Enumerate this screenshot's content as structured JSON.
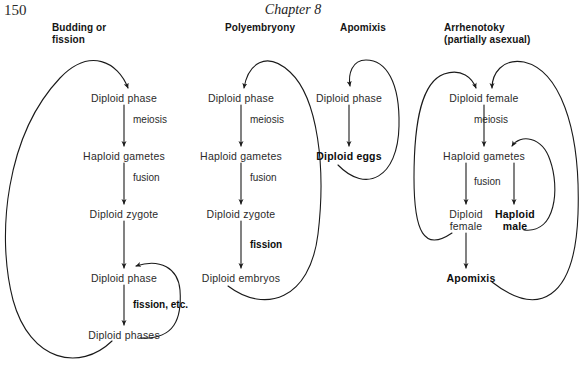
{
  "page": {
    "number": "150",
    "running_head": "Chapter 8"
  },
  "columns": [
    {
      "id": "budding-or-fission",
      "heading_lines": [
        "Budding or",
        "fission"
      ],
      "nodes": [
        {
          "id": "c1-n1",
          "text": "Diploid phase",
          "bold": false,
          "x": 123,
          "y": 97
        },
        {
          "id": "c1-n2",
          "text": "Haploid gametes",
          "bold": false,
          "x": 123,
          "y": 155
        },
        {
          "id": "c1-n3",
          "text": "Diploid zygote",
          "bold": false,
          "x": 123,
          "y": 213
        },
        {
          "id": "c1-n4",
          "text": "Diploid phase",
          "bold": false,
          "x": 123,
          "y": 277
        },
        {
          "id": "c1-n5",
          "text": "Diploid phases",
          "bold": false,
          "x": 123,
          "y": 334
        }
      ],
      "edge_labels": [
        {
          "id": "c1-e1",
          "text": "meiosis",
          "bold": false,
          "x": 131,
          "y": 119
        },
        {
          "id": "c1-e2",
          "text": "fusion",
          "bold": false,
          "x": 131,
          "y": 177
        },
        {
          "id": "c1-e3",
          "text": "fission, etc.",
          "bold": true,
          "x": 131,
          "y": 304
        }
      ]
    },
    {
      "id": "polyembryony",
      "heading_lines": [
        "Polyembryony"
      ],
      "nodes": [
        {
          "id": "c2-n1",
          "text": "Diploid phase",
          "bold": false,
          "x": 240,
          "y": 97
        },
        {
          "id": "c2-n2",
          "text": "Haploid gametes",
          "bold": false,
          "x": 240,
          "y": 155
        },
        {
          "id": "c2-n3",
          "text": "Diploid zygote",
          "bold": false,
          "x": 240,
          "y": 213
        },
        {
          "id": "c2-n4",
          "text": "Diploid embryos",
          "bold": false,
          "x": 240,
          "y": 277
        }
      ],
      "edge_labels": [
        {
          "id": "c2-e1",
          "text": "meiosis",
          "bold": false,
          "x": 248,
          "y": 119
        },
        {
          "id": "c2-e2",
          "text": "fusion",
          "bold": false,
          "x": 248,
          "y": 177
        },
        {
          "id": "c2-e3",
          "text": "fission",
          "bold": true,
          "x": 248,
          "y": 244
        }
      ]
    },
    {
      "id": "apomixis",
      "heading_lines": [
        "Apomixis"
      ],
      "nodes": [
        {
          "id": "c3-n1",
          "text": "Diploid phase",
          "bold": false,
          "x": 348,
          "y": 97
        },
        {
          "id": "c3-n2",
          "text": "Diploid eggs",
          "bold": true,
          "x": 348,
          "y": 155
        }
      ],
      "edge_labels": []
    },
    {
      "id": "arrhenotoky",
      "heading_lines": [
        "Arrhenotoky",
        "(partially asexual)"
      ],
      "nodes": [
        {
          "id": "c4-n1",
          "text": "Diploid female",
          "bold": false,
          "x": 483,
          "y": 97
        },
        {
          "id": "c4-n2",
          "text": "Haploid gametes",
          "bold": false,
          "x": 483,
          "y": 155
        },
        {
          "id": "c4-n3a",
          "text": "Diploid",
          "bold": false,
          "x": 464,
          "y": 213
        },
        {
          "id": "c4-n3b",
          "text": "female",
          "bold": false,
          "x": 464,
          "y": 225
        },
        {
          "id": "c4-n4a",
          "text": "Haploid",
          "bold": true,
          "x": 512,
          "y": 213
        },
        {
          "id": "c4-n4b",
          "text": "male",
          "bold": true,
          "x": 512,
          "y": 225
        },
        {
          "id": "c4-n5",
          "text": "Apomixis",
          "bold": true,
          "x": 476,
          "y": 277
        }
      ],
      "edge_labels": [
        {
          "id": "c4-e1",
          "text": "meiosis",
          "bold": false,
          "x": 472,
          "y": 119
        },
        {
          "id": "c4-e2",
          "text": "fusion",
          "bold": false,
          "x": 472,
          "y": 181
        }
      ]
    }
  ],
  "style": {
    "ink": "#1a1a1a",
    "paper": "#ffffff",
    "stroke_width": "1.1"
  },
  "heading_positions": [
    {
      "x": 100,
      "y": 22
    },
    {
      "x": 240,
      "y": 22
    },
    {
      "x": 348,
      "y": 22
    },
    {
      "x": 483,
      "y": 22
    }
  ]
}
